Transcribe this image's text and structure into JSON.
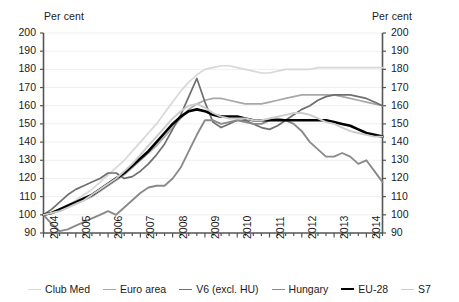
{
  "axes": {
    "left_unit": "Per cent",
    "right_unit": "Per cent",
    "y_ticks": [
      "200",
      "190",
      "180",
      "170",
      "160",
      "150",
      "140",
      "130",
      "120",
      "110",
      "100",
      "90"
    ],
    "x_ticks": [
      "2004",
      "2005",
      "2006",
      "2007",
      "2008",
      "2009",
      "2010",
      "2011",
      "2012",
      "2013",
      "2014"
    ]
  },
  "legend": {
    "items": [
      {
        "label": "Club Med",
        "color": "#d8d8d8",
        "width": 1.7
      },
      {
        "label": "Euro area",
        "color": "#a8a8a8",
        "width": 1.7
      },
      {
        "label": "V6 (excl. HU)",
        "color": "#6f6f6f",
        "width": 1.7
      },
      {
        "label": "Hungary",
        "color": "#8a8a8a",
        "width": 1.9
      },
      {
        "label": "EU-28",
        "color": "#000000",
        "width": 2.6
      },
      {
        "label": "S7",
        "color": "#cccccc",
        "width": 1.9
      }
    ]
  },
  "chart_data": {
    "type": "line",
    "title": "",
    "xlabel": "",
    "ylabel": "Per cent",
    "ylim": [
      90,
      200
    ],
    "ytick_step": 10,
    "grid": true,
    "legend_position": "bottom",
    "x": [
      "2004Q1",
      "2004Q2",
      "2004Q3",
      "2004Q4",
      "2005Q1",
      "2005Q2",
      "2005Q3",
      "2005Q4",
      "2006Q1",
      "2006Q2",
      "2006Q3",
      "2006Q4",
      "2007Q1",
      "2007Q2",
      "2007Q3",
      "2007Q4",
      "2008Q1",
      "2008Q2",
      "2008Q3",
      "2008Q4",
      "2009Q1",
      "2009Q2",
      "2009Q3",
      "2009Q4",
      "2010Q1",
      "2010Q2",
      "2010Q3",
      "2010Q4",
      "2011Q1",
      "2011Q2",
      "2011Q3",
      "2011Q4",
      "2012Q1",
      "2012Q2",
      "2012Q3",
      "2012Q4",
      "2013Q1",
      "2013Q2",
      "2013Q3",
      "2013Q4",
      "2014Q1",
      "2014Q2",
      "2014Q3"
    ],
    "series": [
      {
        "name": "Club Med",
        "color": "#d8d8d8",
        "width": 1.7,
        "values": [
          100,
          101,
          103,
          105,
          108,
          111,
          114,
          118,
          122,
          126,
          130,
          135,
          140,
          145,
          150,
          156,
          162,
          168,
          173,
          177,
          180,
          181,
          182,
          182,
          181,
          180,
          179,
          178,
          178,
          179,
          180,
          180,
          180,
          180,
          181,
          181,
          181,
          181,
          181,
          181,
          181,
          181,
          181
        ]
      },
      {
        "name": "Euro area",
        "color": "#a8a8a8",
        "width": 1.7,
        "values": [
          100,
          101,
          102,
          104,
          106,
          108,
          110,
          113,
          116,
          119,
          122,
          126,
          130,
          134,
          138,
          143,
          148,
          153,
          158,
          161,
          163,
          164,
          164,
          163,
          162,
          161,
          161,
          161,
          162,
          163,
          164,
          165,
          166,
          166,
          166,
          166,
          166,
          165,
          164,
          163,
          162,
          161,
          160
        ]
      },
      {
        "name": "V6 (excl. HU)",
        "color": "#6f6f6f",
        "width": 1.7,
        "values": [
          100,
          103,
          107,
          111,
          114,
          116,
          118,
          120,
          123,
          123,
          120,
          121,
          124,
          128,
          133,
          139,
          147,
          155,
          165,
          175,
          162,
          151,
          148,
          150,
          152,
          152,
          150,
          148,
          147,
          149,
          152,
          155,
          158,
          160,
          163,
          165,
          166,
          166,
          166,
          165,
          164,
          162,
          160
        ]
      },
      {
        "name": "Hungary",
        "color": "#8a8a8a",
        "width": 1.9,
        "values": [
          100,
          95,
          91,
          92,
          94,
          96,
          98,
          100,
          102,
          100,
          104,
          108,
          112,
          115,
          116,
          116,
          120,
          126,
          135,
          144,
          152,
          152,
          150,
          151,
          152,
          151,
          150,
          150,
          152,
          153,
          152,
          150,
          146,
          140,
          136,
          132,
          132,
          134,
          132,
          128,
          130,
          124,
          118
        ]
      },
      {
        "name": "EU-28",
        "color": "#000000",
        "width": 2.6,
        "values": [
          100,
          101,
          103,
          105,
          107,
          109,
          111,
          114,
          117,
          120,
          123,
          127,
          131,
          135,
          140,
          145,
          150,
          154,
          157,
          158,
          157,
          155,
          154,
          154,
          154,
          153,
          152,
          152,
          152,
          152,
          152,
          152,
          152,
          152,
          152,
          152,
          151,
          150,
          149,
          147,
          145,
          144,
          143
        ]
      },
      {
        "name": "S7",
        "color": "#cccccc",
        "width": 1.9,
        "values": [
          100,
          101,
          102,
          104,
          106,
          108,
          111,
          114,
          117,
          120,
          124,
          128,
          133,
          138,
          143,
          148,
          153,
          157,
          160,
          161,
          159,
          156,
          154,
          153,
          153,
          153,
          152,
          152,
          153,
          154,
          155,
          156,
          156,
          155,
          153,
          151,
          150,
          148,
          146,
          145,
          144,
          143,
          143
        ]
      }
    ]
  }
}
